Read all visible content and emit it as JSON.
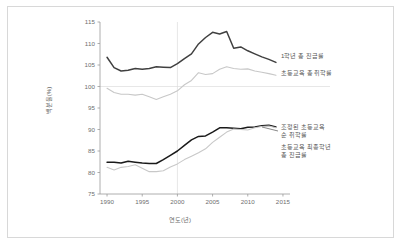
{
  "chart_data": {
    "type": "line",
    "title": "",
    "xlabel": "연도(년)",
    "ylabel": "백분율(%)",
    "xlim": [
      1989,
      2016
    ],
    "ylim": [
      75,
      115
    ],
    "yticks": [
      75,
      80,
      85,
      90,
      95,
      100,
      105,
      110,
      115
    ],
    "xticks": [
      1990,
      1995,
      2000,
      2005,
      2010,
      2015
    ],
    "grid": "horizontal line at y=100; vertical reference line at x=2000",
    "legend_position": "inline-right",
    "colors": {
      "dark": "#404040",
      "light": "#c8c8c8",
      "axis": "#9a9a9a",
      "grid": "#dcdcdc",
      "frame": "#d8d8d8",
      "text": "#6e6e6e"
    },
    "series": [
      {
        "name": "1학년 총 진급률",
        "color": "#404040",
        "label_line": 1,
        "x": [
          1990,
          1991,
          1992,
          1993,
          1994,
          1995,
          1996,
          1997,
          1998,
          1999,
          2000,
          2001,
          2002,
          2003,
          2004,
          2005,
          2006,
          2007,
          2008,
          2009,
          2010,
          2011,
          2012,
          2013,
          2014
        ],
        "values": [
          106.8,
          104.4,
          103.6,
          103.8,
          104.2,
          104.0,
          104.2,
          104.6,
          104.5,
          104.4,
          105.3,
          106.5,
          107.6,
          109.9,
          111.4,
          112.6,
          112.2,
          112.8,
          108.9,
          109.2,
          108.3,
          107.6,
          106.9,
          106.3,
          105.6
        ]
      },
      {
        "name": "초등교육 총 취학률",
        "color": "#c8c8c8",
        "label_line": 2,
        "x": [
          1990,
          1991,
          1992,
          1993,
          1994,
          1995,
          1996,
          1997,
          1998,
          1999,
          2000,
          2001,
          2002,
          2003,
          2004,
          2005,
          2006,
          2007,
          2008,
          2009,
          2010,
          2011,
          2012,
          2013,
          2014
        ],
        "values": [
          99.6,
          98.6,
          98.2,
          98.2,
          98.0,
          98.2,
          97.6,
          97.0,
          97.6,
          98.2,
          99.0,
          100.4,
          101.4,
          103.2,
          102.8,
          103.0,
          104.0,
          104.6,
          104.2,
          104.0,
          104.1,
          103.6,
          103.3,
          103.0,
          102.6
        ]
      },
      {
        "name": "조정된 초등교육 순 취학률",
        "color": "#1a1a1a",
        "label_line": 3,
        "x": [
          1990,
          1991,
          1992,
          1993,
          1994,
          1995,
          1996,
          1997,
          1998,
          1999,
          2000,
          2001,
          2002,
          2003,
          2004,
          2005,
          2006,
          2007,
          2008,
          2009,
          2010,
          2011,
          2012,
          2013,
          2014
        ],
        "values": [
          82.4,
          82.4,
          82.2,
          82.6,
          82.4,
          82.2,
          82.1,
          82.1,
          83.0,
          84.0,
          85.0,
          86.3,
          87.6,
          88.4,
          88.5,
          89.4,
          90.4,
          90.4,
          90.3,
          90.2,
          90.5,
          90.6,
          90.9,
          91.0,
          90.6
        ]
      },
      {
        "name": "초등교육 최종학년 총 진급률",
        "color": "#c8c8c8",
        "label_line": 4,
        "x": [
          1990,
          1991,
          1992,
          1993,
          1994,
          1995,
          1996,
          1997,
          1998,
          1999,
          2000,
          2001,
          2002,
          2003,
          2004,
          2005,
          2006,
          2007,
          2008,
          2009,
          2010,
          2011,
          2012,
          2013,
          2014
        ],
        "values": [
          81.2,
          80.6,
          81.2,
          81.4,
          81.8,
          81.0,
          80.2,
          80.2,
          80.4,
          81.3,
          82.0,
          83.0,
          83.8,
          84.6,
          85.5,
          87.0,
          88.2,
          89.4,
          90.1,
          90.0,
          89.9,
          90.4,
          90.7,
          90.8,
          90.4
        ]
      }
    ],
    "series_labels": [
      {
        "text": "1학년 총 진급률",
        "x": 281,
        "y": 52
      },
      {
        "text": "초등교육 총 취학률",
        "x": 281,
        "y": 69
      },
      {
        "text": "조정된 초등교육",
        "x": 281,
        "y": 123
      },
      {
        "text": "순 취학률",
        "x": 281,
        "y": 131
      },
      {
        "text": "초등교육 최종학년",
        "x": 281,
        "y": 143
      },
      {
        "text": "총 진급률",
        "x": 281,
        "y": 151
      }
    ]
  }
}
